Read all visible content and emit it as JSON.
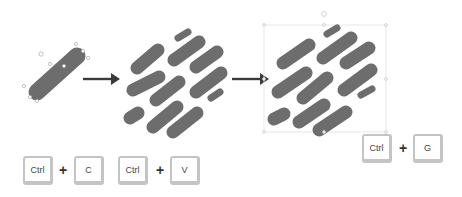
{
  "diagram": {
    "colors": {
      "pill": "#6d6d6d",
      "arrow": "#3a3a3a",
      "handle": "#b0b0b0",
      "selection": "#d9d9d9",
      "key_border": "#c4c4c4",
      "key_text": "#444444"
    },
    "steps": [
      {
        "id": "single-shape",
        "description": "Single selected rounded pill shape with resize handles"
      },
      {
        "id": "duplicated-shapes",
        "description": "Pill shape duplicated into diagonal pattern of 11 pills"
      },
      {
        "id": "grouped-shapes",
        "description": "All pills selected inside a single group bounding box"
      }
    ],
    "arrows": [
      {
        "from": "single-shape",
        "to": "duplicated-shapes",
        "icon": "right-arrow-icon"
      },
      {
        "from": "duplicated-shapes",
        "to": "grouped-shapes",
        "icon": "right-arrow-icon"
      }
    ],
    "shortcuts": [
      {
        "name": "copy",
        "keys": [
          "Ctrl",
          "C"
        ],
        "separator": "+"
      },
      {
        "name": "paste",
        "keys": [
          "Ctrl",
          "V"
        ],
        "separator": "+"
      },
      {
        "name": "group",
        "keys": [
          "Ctrl",
          "G"
        ],
        "separator": "+"
      }
    ]
  }
}
